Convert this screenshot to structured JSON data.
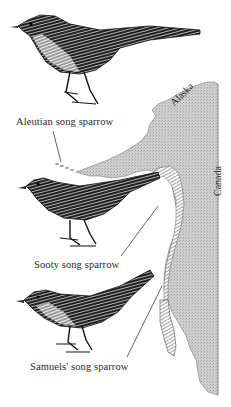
{
  "figure": {
    "birds": [
      {
        "id": "aleutian",
        "label": "Aleutian song sparrow"
      },
      {
        "id": "sooty",
        "label": "Sooty song sparrow"
      },
      {
        "id": "samuels",
        "label": "Samuels' song sparrow"
      }
    ],
    "map": {
      "regions": [
        {
          "id": "alaska",
          "label": "Alaska"
        },
        {
          "id": "canada",
          "label": "Canada"
        }
      ],
      "colors": {
        "land": "#c9c9c9",
        "hatch": "#555555",
        "ink": "#1a1a1a",
        "background": "#ffffff"
      }
    }
  }
}
